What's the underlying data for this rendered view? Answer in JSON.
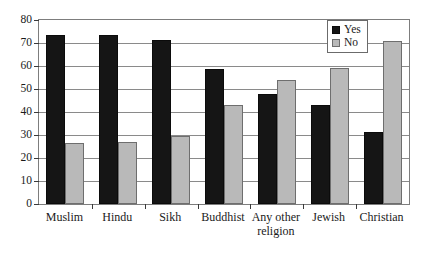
{
  "chart_data": {
    "type": "bar",
    "title": "",
    "xlabel": "",
    "ylabel": "",
    "ylim": [
      0,
      80
    ],
    "ytick_step": 10,
    "yticks": [
      0,
      10,
      20,
      30,
      40,
      50,
      60,
      70,
      80
    ],
    "ytick_labels": [
      "0",
      "10",
      "20",
      "30",
      "40",
      "50",
      "60",
      "70",
      "80"
    ],
    "grid": true,
    "grid_axis": "y",
    "legend_position": "top-right",
    "categories": [
      "Muslim",
      "Hindu",
      "Sikh",
      "Buddhist",
      "Any other\nreligion",
      "Jewish",
      "Christian"
    ],
    "series": [
      {
        "name": "Yes",
        "color": "#151515",
        "values": [
          73.5,
          73.5,
          71.5,
          58.5,
          48,
          43,
          31.5
        ]
      },
      {
        "name": "No",
        "color": "#b9b9b9",
        "values": [
          26.5,
          27,
          29.5,
          43,
          54,
          59,
          71
        ]
      }
    ]
  },
  "legend": {
    "items": [
      {
        "label": "Yes",
        "swatch": "black-square"
      },
      {
        "label": "No",
        "swatch": "gray-square"
      }
    ]
  }
}
